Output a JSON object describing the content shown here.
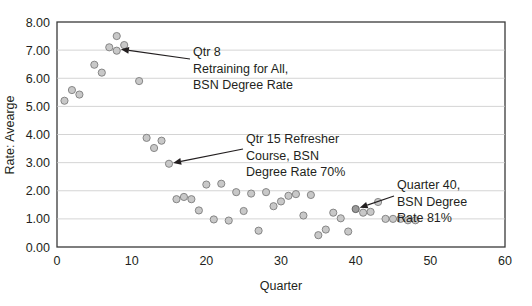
{
  "chart_data": {
    "type": "scatter",
    "title": "",
    "xlabel": "Quarter",
    "ylabel": "Rate: Aveargе",
    "xlim": [
      0,
      60
    ],
    "ylim": [
      0,
      8
    ],
    "xticks": [
      0,
      10,
      20,
      30,
      40,
      50,
      60
    ],
    "xtick_labels": [
      "0",
      "10",
      "20",
      "30",
      "40",
      "50",
      "60"
    ],
    "yticks": [
      0,
      1,
      2,
      3,
      4,
      5,
      6,
      7,
      8
    ],
    "ytick_labels": [
      "0.00",
      "1.00",
      "2.00",
      "3.00",
      "4.00",
      "5.00",
      "6.00",
      "7.00",
      "8.00"
    ],
    "grid": "horizontal",
    "legend": "none",
    "marker_color": "#c8c8c8",
    "marker_edge_color": "#7d7d7d",
    "series": [
      {
        "name": "Rate: Average",
        "points": [
          {
            "x": 1,
            "y": 5.2
          },
          {
            "x": 2,
            "y": 5.58
          },
          {
            "x": 3,
            "y": 5.42
          },
          {
            "x": 5,
            "y": 6.48
          },
          {
            "x": 6,
            "y": 6.2
          },
          {
            "x": 7,
            "y": 7.1
          },
          {
            "x": 8,
            "y": 7.5
          },
          {
            "x": 8,
            "y": 6.98
          },
          {
            "x": 9,
            "y": 7.18
          },
          {
            "x": 11,
            "y": 5.9
          },
          {
            "x": 12,
            "y": 3.88
          },
          {
            "x": 13,
            "y": 3.52
          },
          {
            "x": 14,
            "y": 3.78
          },
          {
            "x": 15,
            "y": 2.96
          },
          {
            "x": 16,
            "y": 1.7
          },
          {
            "x": 17,
            "y": 1.78
          },
          {
            "x": 18,
            "y": 1.7
          },
          {
            "x": 19,
            "y": 1.3
          },
          {
            "x": 20,
            "y": 2.22
          },
          {
            "x": 21,
            "y": 0.98
          },
          {
            "x": 22,
            "y": 2.25
          },
          {
            "x": 23,
            "y": 0.94
          },
          {
            "x": 24,
            "y": 1.95
          },
          {
            "x": 25,
            "y": 1.28
          },
          {
            "x": 26,
            "y": 1.9
          },
          {
            "x": 27,
            "y": 0.58
          },
          {
            "x": 28,
            "y": 1.95
          },
          {
            "x": 29,
            "y": 1.45
          },
          {
            "x": 30,
            "y": 1.62
          },
          {
            "x": 31,
            "y": 1.82
          },
          {
            "x": 32,
            "y": 1.88
          },
          {
            "x": 33,
            "y": 1.12
          },
          {
            "x": 34,
            "y": 1.85
          },
          {
            "x": 35,
            "y": 0.42
          },
          {
            "x": 36,
            "y": 0.62
          },
          {
            "x": 37,
            "y": 1.22
          },
          {
            "x": 38,
            "y": 1.02
          },
          {
            "x": 39,
            "y": 0.55
          },
          {
            "x": 40,
            "y": 1.35,
            "highlight": true
          },
          {
            "x": 41,
            "y": 1.22
          },
          {
            "x": 42,
            "y": 1.25
          },
          {
            "x": 43,
            "y": 1.6
          },
          {
            "x": 44,
            "y": 1.0
          },
          {
            "x": 45,
            "y": 1.0
          },
          {
            "x": 46,
            "y": 1.0
          },
          {
            "x": 47,
            "y": 0.95
          },
          {
            "x": 48,
            "y": 0.95
          }
        ]
      }
    ],
    "annotations": [
      {
        "id": "qtr8",
        "lines": [
          "Qtr 8",
          "Retraining for All,",
          "BSN Degree Rate"
        ],
        "target": {
          "x": 8,
          "y": 7.05
        }
      },
      {
        "id": "qtr15",
        "lines": [
          "Qtr 15 Refresher",
          "Course, BSN",
          "Degree Rate 70%"
        ],
        "target": {
          "x": 15,
          "y": 2.96
        }
      },
      {
        "id": "qtr40",
        "lines": [
          "Quarter 40,",
          "BSN Degree",
          "Rate 81%"
        ],
        "target": {
          "x": 40,
          "y": 1.35
        }
      }
    ]
  }
}
